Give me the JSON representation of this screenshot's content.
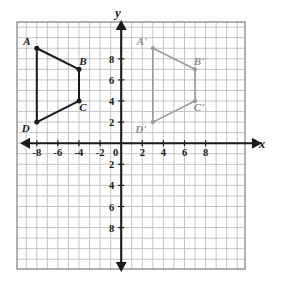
{
  "chart_data": {
    "type": "scatter",
    "title": "",
    "xlabel": "x",
    "ylabel": "y",
    "grid": true,
    "legend": "none",
    "xlim": [
      -9.5,
      9.5
    ],
    "ylim": [
      -9.5,
      9.5
    ],
    "x_tick_labels": [
      "-8",
      "-6",
      "-4",
      "-2",
      "0",
      "2",
      "4",
      "6",
      "8"
    ],
    "x_tick_values": [
      -8,
      -6,
      -4,
      -2,
      0,
      2,
      4,
      6,
      8
    ],
    "y_tick_labels": [
      "8",
      "6",
      "4",
      "2",
      "2",
      "4",
      "6",
      "8"
    ],
    "y_tick_values": [
      8,
      6,
      4,
      2,
      -2,
      -4,
      -6,
      -8
    ],
    "grid_step": 1,
    "tick_step": 2,
    "series": [
      {
        "name": "ABCD",
        "type": "polygon",
        "color": "#1a1a1a",
        "closed": false,
        "points": [
          {
            "label": "A",
            "x": -8,
            "y": 9,
            "label_dx": -10,
            "label_dy": -3
          },
          {
            "label": "B",
            "x": -4,
            "y": 7,
            "label_dx": 4,
            "label_dy": -4
          },
          {
            "label": "C",
            "x": -4,
            "y": 4,
            "label_dx": 4,
            "label_dy": 10
          },
          {
            "label": "D",
            "x": -8,
            "y": 2,
            "label_dx": -11,
            "label_dy": 10
          }
        ]
      },
      {
        "name": "A'B'C'D'",
        "type": "polygon",
        "color": "#9a9a9a",
        "closed": false,
        "points": [
          {
            "label": "A'",
            "x": 3,
            "y": 9,
            "label_dx": -11,
            "label_dy": -3
          },
          {
            "label": "B'",
            "x": 7,
            "y": 7,
            "label_dx": 4,
            "label_dy": -4
          },
          {
            "label": "C'",
            "x": 7,
            "y": 4,
            "label_dx": 4,
            "label_dy": 10
          },
          {
            "label": "D'",
            "x": 3,
            "y": 2,
            "label_dx": -12,
            "label_dy": 11
          }
        ]
      }
    ]
  },
  "axes": {
    "x_axis_label": "x",
    "y_axis_label": "y",
    "origin_label": "0"
  },
  "colors": {
    "background": "#ffffff",
    "grid_line": "#b9b9b9",
    "grid_border": "#7d7d7d",
    "axis": "#1a1a1a",
    "preimage": "#1a1a1a",
    "image": "#9a9a9a",
    "text": "#1a1a1a",
    "image_text": "#8d8d8d"
  }
}
